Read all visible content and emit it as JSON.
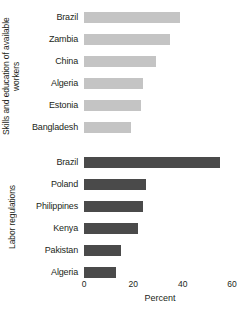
{
  "chart_data": {
    "type": "bar",
    "orientation": "horizontal",
    "title": "",
    "xlabel": "Percent",
    "ylabel": "",
    "xlim": [
      0,
      60
    ],
    "xticks": [
      0,
      20,
      40,
      60
    ],
    "xticklabels": [
      "0",
      "20",
      "40",
      "60"
    ],
    "grid": false,
    "legend": false,
    "groups": [
      {
        "name": "Skills and education of available workers",
        "color": "#c4c4c4",
        "categories": [
          "Brazil",
          "Zambia",
          "China",
          "Algeria",
          "Estonia",
          "Bangladesh"
        ],
        "values": [
          39,
          35,
          29,
          24,
          23,
          19
        ]
      },
      {
        "name": "Labor regulations",
        "color": "#4a4a4a",
        "categories": [
          "Brazil",
          "Poland",
          "Philippines",
          "Kenya",
          "Pakistan",
          "Algeria"
        ],
        "values": [
          55,
          25,
          24,
          22,
          15,
          13
        ]
      }
    ]
  },
  "axis": {
    "x_title": "Percent",
    "ticks": [
      "0",
      "20",
      "40",
      "60"
    ]
  },
  "groups": {
    "skills": {
      "label": "Skills and education of available workers",
      "rows": [
        {
          "label": "Brazil",
          "value": 39
        },
        {
          "label": "Zambia",
          "value": 35
        },
        {
          "label": "China",
          "value": 29
        },
        {
          "label": "Algeria",
          "value": 24
        },
        {
          "label": "Estonia",
          "value": 23
        },
        {
          "label": "Bangladesh",
          "value": 19
        }
      ]
    },
    "labor": {
      "label": "Labor regulations",
      "rows": [
        {
          "label": "Brazil",
          "value": 55
        },
        {
          "label": "Poland",
          "value": 25
        },
        {
          "label": "Philippines",
          "value": 24
        },
        {
          "label": "Kenya",
          "value": 22
        },
        {
          "label": "Pakistan",
          "value": 15
        },
        {
          "label": "Algeria",
          "value": 13
        }
      ]
    }
  },
  "colors": {
    "light_bar": "#c4c4c4",
    "dark_bar": "#4a4a4a",
    "text": "#231f20"
  }
}
